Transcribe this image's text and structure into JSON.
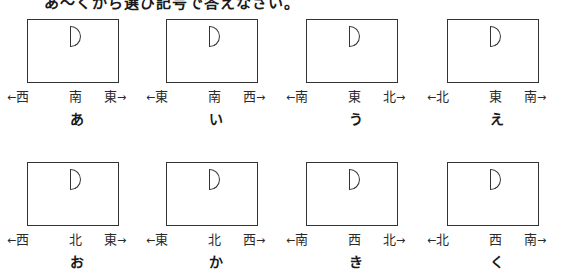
{
  "instruction": "あ～くから選び記号で答えなさい。",
  "arrows": {
    "left": "←",
    "right": "→"
  },
  "panels": [
    {
      "letter": "あ",
      "left": "西",
      "center": "南",
      "right": "東"
    },
    {
      "letter": "い",
      "left": "東",
      "center": "南",
      "right": "西"
    },
    {
      "letter": "う",
      "left": "南",
      "center": "東",
      "right": "北"
    },
    {
      "letter": "え",
      "left": "北",
      "center": "東",
      "right": "南"
    },
    {
      "letter": "お",
      "left": "西",
      "center": "北",
      "right": "東"
    },
    {
      "letter": "か",
      "left": "東",
      "center": "北",
      "right": "西"
    },
    {
      "letter": "き",
      "left": "南",
      "center": "西",
      "right": "北"
    },
    {
      "letter": "く",
      "left": "北",
      "center": "西",
      "right": "南"
    }
  ]
}
